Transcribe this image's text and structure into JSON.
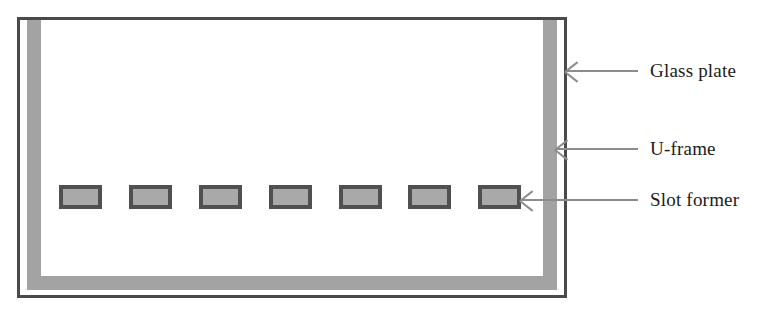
{
  "figure": {
    "type": "technical-diagram",
    "colors": {
      "glass_plate_outline": "#4a4a4a",
      "u_frame_fill": "#a3a3a3",
      "slot_former_border": "#505050",
      "slot_former_fill": "#a9a9a9",
      "arrow": "#8c8c8c",
      "label_text": "#1b1b1b",
      "background": "#ffffff"
    }
  },
  "components": {
    "glass_plate": {
      "name": "Glass plate",
      "shape": "rectangle-outline"
    },
    "u_frame": {
      "name": "U-frame",
      "shape": "u-channel"
    },
    "slot_former": {
      "name": "Slot former",
      "shape": "rectangle",
      "count": 7
    }
  },
  "slot_formers": [
    {
      "index": 1,
      "left": 0
    },
    {
      "index": 2,
      "left": 70
    },
    {
      "index": 3,
      "left": 140
    },
    {
      "index": 4,
      "left": 210
    },
    {
      "index": 5,
      "left": 280
    },
    {
      "index": 6,
      "left": 349
    },
    {
      "index": 7,
      "left": 419
    }
  ],
  "callouts": [
    {
      "id": "glass-plate",
      "label": "Glass plate",
      "arrow_top": 70,
      "arrow_left": 566,
      "arrow_length": 72,
      "label_left": 650,
      "label_top": 61
    },
    {
      "id": "u-frame",
      "label": "U-frame",
      "arrow_top": 148,
      "arrow_left": 556,
      "arrow_length": 82,
      "label_left": 650,
      "label_top": 139
    },
    {
      "id": "slot-former",
      "label": "Slot former",
      "arrow_top": 199,
      "arrow_left": 521,
      "arrow_length": 117,
      "label_left": 650,
      "label_top": 190
    }
  ]
}
